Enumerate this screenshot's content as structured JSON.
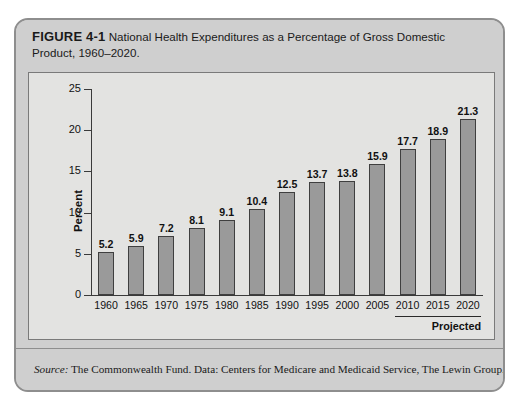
{
  "figure": {
    "label": "FIGURE 4-1",
    "title": "National Health Expenditures as a Percentage of Gross Domestic Product, 1960–2020."
  },
  "source": {
    "lead": "Source:",
    "text": " The Commonwealth Fund. Data: Centers for Medicare and Medicaid Service, The Lewin Group."
  },
  "annotations": {
    "projected_label": "Projected"
  },
  "colors": {
    "frame": "#8e8e8e",
    "caption_band": "#cfcfcf",
    "panel_background": "#e3e3e1",
    "bar_fill": "#9a9a9a",
    "bar_stroke": "#3f3f3f",
    "axis": "#3a3a3a"
  },
  "chart_data": {
    "type": "bar",
    "title": "National Health Expenditures as a Percentage of Gross Domestic Product, 1960–2020.",
    "xlabel": "",
    "ylabel": "Percent",
    "categories": [
      "1960",
      "1965",
      "1970",
      "1975",
      "1980",
      "1985",
      "1990",
      "1995",
      "2000",
      "2005",
      "2010",
      "2015",
      "2020"
    ],
    "values": [
      5.2,
      5.9,
      7.2,
      8.1,
      9.1,
      10.4,
      12.5,
      13.7,
      13.8,
      15.9,
      17.7,
      18.9,
      21.3
    ],
    "value_labels": [
      "5.2",
      "5.9",
      "7.2",
      "8.1",
      "9.1",
      "10.4",
      "12.5",
      "13.7",
      "13.8",
      "15.9",
      "17.7",
      "18.9",
      "21.3"
    ],
    "ylim": [
      0,
      25
    ],
    "yticks": [
      0,
      5,
      10,
      15,
      20,
      25
    ],
    "ytick_labels": [
      "0",
      "5",
      "10",
      "15",
      "20",
      "25"
    ],
    "grid": false,
    "legend": false,
    "annotations": [
      {
        "text": "Projected",
        "spans_categories": [
          "2010",
          "2015",
          "2020"
        ]
      }
    ]
  }
}
